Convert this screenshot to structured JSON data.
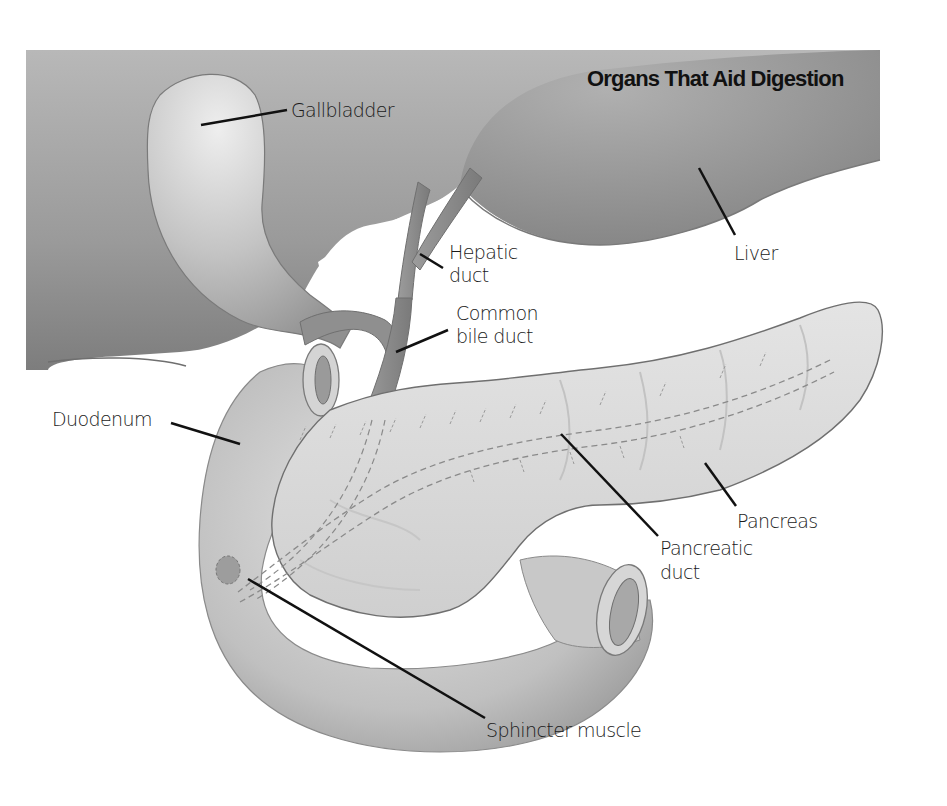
{
  "figure": {
    "title": "Organs That Aid Digestion",
    "background": "#ffffff",
    "colors": {
      "liver": "#8e8e8e",
      "liver_light": "#b9b9b9",
      "gallbladder": "#c9c9c9",
      "duct": "#8a8a8a",
      "duodenum": "#cfcfcf",
      "pancreas": "#dedede",
      "outline": "#6f6f6f",
      "leader_line": "#111111",
      "text": "#1a1a1a"
    }
  },
  "labels": {
    "gallbladder": "Gallbladder",
    "hepatic_duct_line1": "Hepatic",
    "hepatic_duct_line2": "duct",
    "common_bile_duct_line1": "Common",
    "common_bile_duct_line2": "bile duct",
    "liver": "Liver",
    "duodenum": "Duodenum",
    "pancreas": "Pancreas",
    "pancreatic_duct_line1": "Pancreatic",
    "pancreatic_duct_line2": "duct",
    "sphincter_muscle": "Sphincter muscle"
  }
}
